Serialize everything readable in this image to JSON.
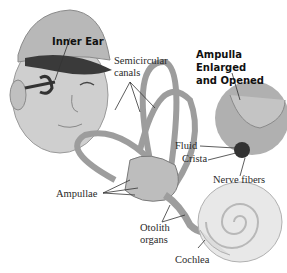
{
  "figure": {
    "head_label": "Inner Ear",
    "inset_title_line1": "Ampulla Enlarged",
    "inset_title_line2": "and Opened",
    "labels": {
      "semicircular_line1": "Semicircular",
      "semicircular_line2": "canals",
      "fluid": "Fluid",
      "crista": "Crista",
      "nerve_fibers": "Nerve fibers",
      "ampullae": "Ampullae",
      "otolith_line1": "Otolith",
      "otolith_line2": "organs",
      "cochlea": "Cochlea"
    }
  },
  "colors": {
    "skin": "#c9c9c9",
    "cap": "#b5b5b5",
    "cap_brim": "#3a3a3a",
    "structure": "#bdbdbd",
    "structure_stroke": "#7a7a7a",
    "inset": "#a9a9a9",
    "line": "#333333"
  }
}
